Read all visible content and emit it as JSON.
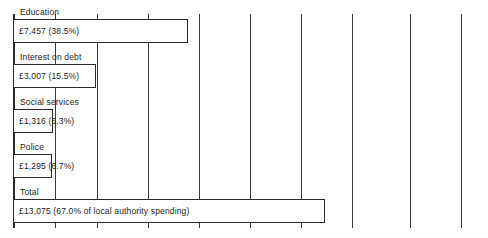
{
  "chart_data": {
    "type": "bar",
    "title": "",
    "subtitle": "",
    "xlabel": "",
    "ylabel": "",
    "orientation": "horizontal",
    "grid": true,
    "legend": false,
    "categories": [
      "Education",
      "Interest on debt",
      "Social services",
      "Police",
      "Total"
    ],
    "values": [
      7457,
      3007,
      1316,
      1295,
      13075
    ],
    "percents": [
      38.5,
      15.5,
      6.3,
      6.7,
      67.0
    ],
    "value_labels": [
      "£7,457 (38.5%)",
      "£3,007 (15.5%)",
      "£1,316 (6.3%)",
      "£1,295 (6.7%)",
      "£13,075 (67.0% of local authority spending)"
    ],
    "xlim": [
      0,
      20000
    ],
    "gridline_step": 2000,
    "gridline_count": 9,
    "units": "£ million",
    "colors": {
      "bar_fill": "#ffffff",
      "bar_stroke": "#2b2b2b",
      "grid": "#3a3a3a",
      "text": "#1c1c1c",
      "background": "#ffffff"
    }
  },
  "rows": [
    {
      "label": "Education",
      "value_label": "£7,457 (38.5%)",
      "bar_width_px": 175
    },
    {
      "label": "Interest on debt",
      "value_label": "£3,007 (15.5%)",
      "bar_width_px": 83
    },
    {
      "label": "Social services",
      "value_label": "£1,316 (6.3%)",
      "bar_width_px": 40
    },
    {
      "label": "Police",
      "value_label": "£1,295 (6.7%)",
      "bar_width_px": 39
    },
    {
      "label": "Total",
      "value_label": "£13,075 (67.0% of local authority spending)",
      "bar_width_px": 312
    }
  ]
}
